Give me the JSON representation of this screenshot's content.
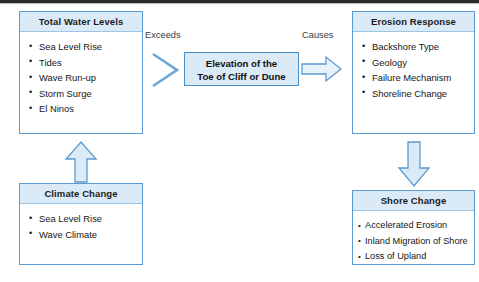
{
  "diagram": {
    "title_rule": true,
    "colors": {
      "box_border": "#5b9bd1",
      "box_header_fill": "#dbeaf7",
      "arrow_fill": "#dbeaf7",
      "arrow_stroke": "#5b9bd1",
      "text": "#161616",
      "label_text": "#3b3b3b"
    },
    "boxes": {
      "total_water_levels": {
        "title": "Total Water Levels",
        "items": [
          "Sea Level Rise",
          "Tides",
          "Wave Run-up",
          "Storm Surge",
          "El Ninos"
        ]
      },
      "climate_change": {
        "title": "Climate Change",
        "items": [
          "Sea Level Rise",
          "Wave Climate"
        ]
      },
      "elevation": {
        "line1": "Elevation of the",
        "line2": "Toe of Cliff or Dune"
      },
      "erosion_response": {
        "title": "Erosion Response",
        "items": [
          "Backshore Type",
          "Geology",
          "Failure Mechanism",
          "Shoreline Change"
        ]
      },
      "shore_change": {
        "title": "Shore Change",
        "items": [
          "Accelerated Erosion",
          "Inland Migration of Shore",
          "Loss of Upland"
        ]
      }
    },
    "connectors": {
      "exceeds_label": "Exceeds",
      "causes_label": "Causes",
      "exceeds_icon": "chevron-right-icon",
      "causes_icon": "arrow-right-icon",
      "climate_to_water_icon": "arrow-up-icon",
      "erosion_to_shore_icon": "arrow-down-icon"
    }
  }
}
